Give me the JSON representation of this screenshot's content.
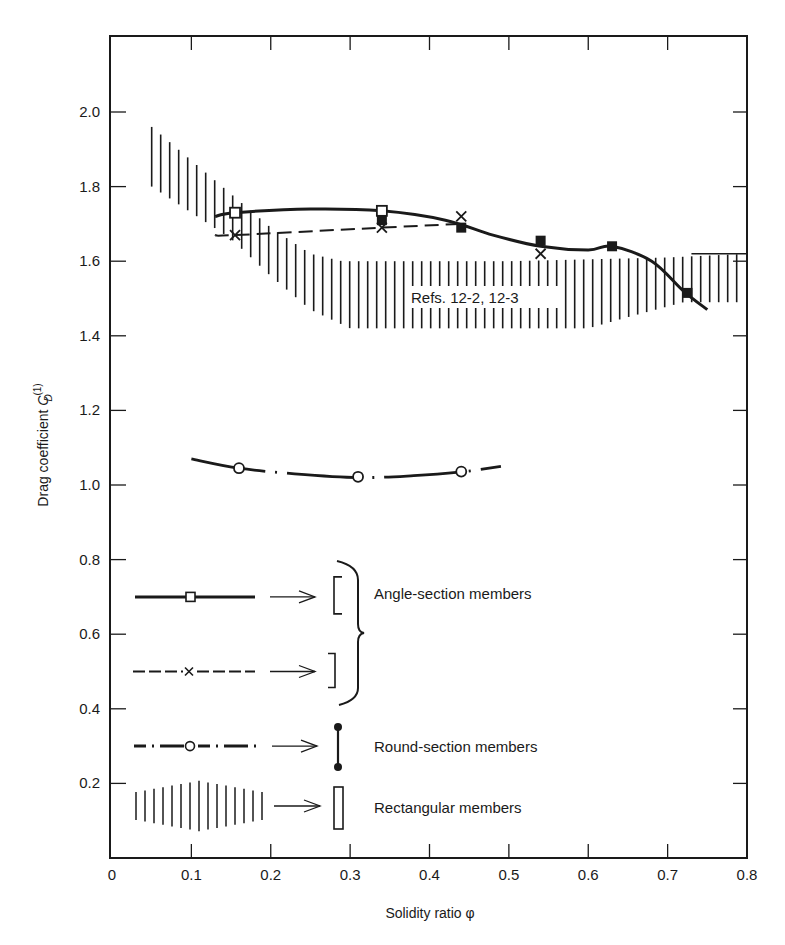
{
  "chart_data": {
    "type": "line",
    "title": "",
    "xlabel": "Solidity ratio φ",
    "ylabel": "Drag coefficient C_D^(1)",
    "ylabel_main": "Drag coefficient ",
    "ylabel_symbol": "C",
    "ylabel_sup": "(1)",
    "ylabel_sub": "D",
    "xlim": [
      0,
      0.8
    ],
    "ylim": [
      0,
      2.2
    ],
    "x_ticks": [
      "0",
      "0.1",
      "0.2",
      "0.3",
      "0.4",
      "0.5",
      "0.6",
      "0.7",
      "0.8"
    ],
    "y_ticks": [
      "0.2",
      "0.4",
      "0.6",
      "0.8",
      "1.0",
      "1.2",
      "1.4",
      "1.6",
      "1.8",
      "2.0"
    ],
    "grid": false,
    "legend_position": "inside lower-left",
    "annotation": "Refs. 12-2, 12-3",
    "series": [
      {
        "name": "Angle-section members (open-side configuration [ )",
        "style": "solid",
        "marker": "square",
        "curve": {
          "x": [
            0.13,
            0.155,
            0.25,
            0.34,
            0.42,
            0.48,
            0.54,
            0.6,
            0.63,
            0.68,
            0.72,
            0.75
          ],
          "y": [
            1.72,
            1.73,
            1.74,
            1.735,
            1.71,
            1.67,
            1.64,
            1.63,
            1.64,
            1.6,
            1.52,
            1.47
          ]
        },
        "open_markers": {
          "x": [
            0.155,
            0.34
          ],
          "y": [
            1.73,
            1.735
          ]
        },
        "filled_markers": {
          "x": [
            0.34,
            0.44,
            0.54,
            0.63,
            0.725
          ],
          "y": [
            1.71,
            1.69,
            1.655,
            1.64,
            1.515
          ]
        }
      },
      {
        "name": "Angle-section members (closed-side configuration ] )",
        "style": "dashed",
        "marker": "x",
        "curve": {
          "x": [
            0.13,
            0.155,
            0.34,
            0.44
          ],
          "y": [
            1.67,
            1.67,
            1.69,
            1.7
          ]
        },
        "markers": {
          "x": [
            0.155,
            0.34,
            0.44,
            0.54
          ],
          "y": [
            1.67,
            1.69,
            1.72,
            1.62
          ]
        }
      },
      {
        "name": "Round-section members",
        "style": "dash-dot",
        "marker": "open circle",
        "curve": {
          "x": [
            0.1,
            0.16,
            0.23,
            0.31,
            0.38,
            0.44,
            0.49
          ],
          "y": [
            1.07,
            1.045,
            1.03,
            1.02,
            1.025,
            1.035,
            1.05
          ]
        },
        "markers": {
          "x": [
            0.16,
            0.31,
            0.44
          ],
          "y": [
            1.045,
            1.022,
            1.036
          ]
        }
      },
      {
        "name": "Rectangular members",
        "style": "hatched band",
        "upper": {
          "x": [
            0.05,
            0.1,
            0.15,
            0.2,
            0.25,
            0.29,
            0.35,
            0.5,
            0.7,
            0.8
          ],
          "y": [
            1.96,
            1.87,
            1.78,
            1.69,
            1.62,
            1.6,
            1.6,
            1.6,
            1.61,
            1.62
          ]
        },
        "lower": {
          "x": [
            0.05,
            0.1,
            0.15,
            0.2,
            0.25,
            0.3,
            0.45,
            0.6,
            0.65,
            0.72,
            0.8
          ],
          "y": [
            1.8,
            1.73,
            1.66,
            1.56,
            1.47,
            1.42,
            1.42,
            1.42,
            1.45,
            1.49,
            1.49
          ]
        }
      }
    ]
  },
  "legend": {
    "items": [
      {
        "label": "Angle-section members",
        "line": "solid",
        "marker": "square",
        "section_glyph": "[ / ]"
      },
      {
        "label": "Round-section members",
        "line": "dash-dot",
        "marker": "open circle",
        "section_glyph": "round bar"
      },
      {
        "label": "Rectangular members",
        "line": "hatched",
        "marker": "",
        "section_glyph": "rectangle"
      }
    ]
  },
  "colors": {
    "ink": "#1a1a1a",
    "background": "#ffffff"
  }
}
